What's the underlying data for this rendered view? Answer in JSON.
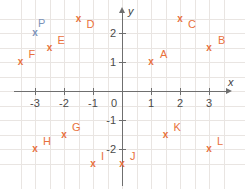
{
  "chart_data": {
    "type": "scatter",
    "title": "",
    "xlabel": "x",
    "ylabel": "y",
    "xlim": [
      -3.9,
      3.6
    ],
    "ylim": [
      -2.9,
      2.9
    ],
    "grid": true,
    "grid_step": 0.5,
    "tick_step": 1,
    "xticks": [
      "-3",
      "-2",
      "-1",
      "0",
      "1",
      "2",
      "3"
    ],
    "xtick_values": [
      -3,
      -2,
      -1,
      0,
      1,
      2,
      3
    ],
    "yticks": [
      "2",
      "1",
      "-1",
      "-2"
    ],
    "ytick_values": [
      2,
      1,
      -1,
      -2
    ],
    "origin_label": "0",
    "marker": "x",
    "points": [
      {
        "label": "A",
        "x": 1,
        "y": 1,
        "color": "#e8713c",
        "label_dx": 9,
        "label_dy": -8
      },
      {
        "label": "B",
        "x": 3,
        "y": 1.5,
        "color": "#e8713c",
        "label_dx": 9,
        "label_dy": -8
      },
      {
        "label": "C",
        "x": 2,
        "y": 2.5,
        "color": "#e8713c",
        "label_dx": 8,
        "label_dy": 5
      },
      {
        "label": "D",
        "x": -1.5,
        "y": 2.5,
        "color": "#e8713c",
        "label_dx": 8,
        "label_dy": 5
      },
      {
        "label": "E",
        "x": -2.5,
        "y": 1.5,
        "color": "#e8713c",
        "label_dx": 8,
        "label_dy": -8
      },
      {
        "label": "F",
        "x": -3.5,
        "y": 1,
        "color": "#e8713c",
        "label_dx": 8,
        "label_dy": -8
      },
      {
        "label": "G",
        "x": -2,
        "y": -1.5,
        "color": "#e8713c",
        "label_dx": 8,
        "label_dy": -8
      },
      {
        "label": "H",
        "x": -3,
        "y": -2,
        "color": "#e8713c",
        "label_dx": 8,
        "label_dy": -8
      },
      {
        "label": "I",
        "x": -1,
        "y": -2.5,
        "color": "#e8713c",
        "label_dx": 8,
        "label_dy": -8
      },
      {
        "label": "J",
        "x": 0,
        "y": -2.5,
        "color": "#e8713c",
        "label_dx": 8,
        "label_dy": -8
      },
      {
        "label": "K",
        "x": 1.5,
        "y": -1.5,
        "color": "#e8713c",
        "label_dx": 8,
        "label_dy": -8
      },
      {
        "label": "L",
        "x": 3,
        "y": -2,
        "color": "#e8713c",
        "label_dx": 8,
        "label_dy": -8
      },
      {
        "label": "P",
        "x": -3,
        "y": 2,
        "color": "#7b93b8",
        "label_dx": 3,
        "label_dy": -10
      }
    ],
    "colors": {
      "marker": "#e8713c",
      "marker_alt": "#7b93b8",
      "grid": "#e9e5e2",
      "axis": "#6f6f6f",
      "tick_text": "#4a4a4a"
    }
  }
}
